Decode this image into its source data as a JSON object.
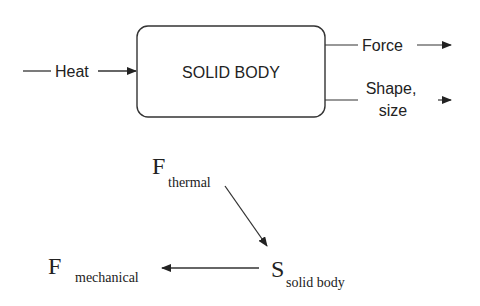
{
  "top_diagram": {
    "box_label": "SOLID BODY",
    "input_label": "Heat",
    "outputs": [
      {
        "label": "Force"
      },
      {
        "label_line1": "Shape,",
        "label_line2": "size"
      }
    ]
  },
  "bottom_diagram": {
    "f_thermal": {
      "main": "F",
      "sub": "thermal"
    },
    "s_solid": {
      "main": "S",
      "sub": "solid body"
    },
    "f_mechanical": {
      "main": "F",
      "sub": "mechanical"
    }
  },
  "colors": {
    "stroke": "#222222",
    "background": "#ffffff"
  }
}
